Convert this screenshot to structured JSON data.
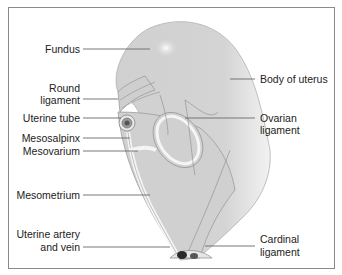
{
  "labels_left": [
    {
      "id": "fundus",
      "text": "Fundus"
    },
    {
      "id": "round-ligament-1",
      "text": "Round"
    },
    {
      "id": "round-ligament-2",
      "text": "ligament"
    },
    {
      "id": "uterine-tube",
      "text": "Uterine tube"
    },
    {
      "id": "mesosalpinx",
      "text": "Mesosalpinx"
    },
    {
      "id": "mesovarium",
      "text": "Mesovarium"
    },
    {
      "id": "mesometrium",
      "text": "Mesometrium"
    },
    {
      "id": "uterine-artery-1",
      "text": "Uterine artery"
    },
    {
      "id": "uterine-artery-2",
      "text": "and vein"
    }
  ],
  "labels_right": [
    {
      "id": "body-of-uterus",
      "text": "Body of uterus"
    },
    {
      "id": "ovarian-ligament-1",
      "text": "Ovarian"
    },
    {
      "id": "ovarian-ligament-2",
      "text": "ligament"
    },
    {
      "id": "cardinal-ligament-1",
      "text": "Cardinal"
    },
    {
      "id": "cardinal-ligament-2",
      "text": "ligament"
    }
  ],
  "colors": {
    "tissue": "#d0d0d0",
    "outline": "#9a9a9a",
    "leader": "#6a6a6a",
    "vessel": "#333333"
  }
}
